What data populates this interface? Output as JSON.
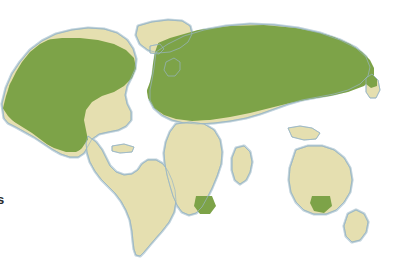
{
  "figure": {
    "type": "distribution-range-world-map",
    "background_color": "#ffffff",
    "caption_fragment": "s"
  },
  "legend_colors": {
    "range_fill": "#7da348",
    "land_fill": "#e5dfb0",
    "coast_halo": "#b8cdd8",
    "coast_line": "#9ab6c4",
    "ocean": "#ffffff"
  },
  "map": {
    "projection": "equirectangular-world",
    "land_regions": [
      "North America",
      "Greenland",
      "South America",
      "Europe",
      "Africa",
      "Asia",
      "Australia",
      "New Zealand",
      "Japan",
      "Madagascar",
      "British Isles",
      "Caribbean",
      "Indonesia"
    ],
    "range_regions": [
      "Alaska",
      "Canada",
      "Northeastern United States",
      "Pacific Northwest",
      "Europe",
      "Scandinavia",
      "Siberia",
      "Kamchatka",
      "Northeast Asia",
      "Cape of South Africa",
      "Southwestern Australia"
    ],
    "absent_regions": [
      "South America",
      "Central Africa",
      "India",
      "Arabia",
      "Central Australia",
      "Greenland"
    ]
  }
}
